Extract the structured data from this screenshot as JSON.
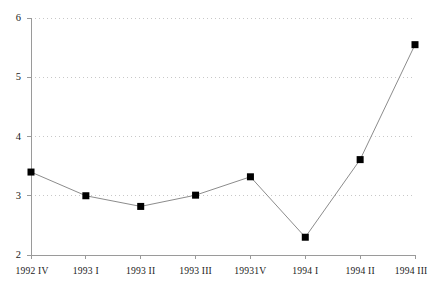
{
  "chart_data": {
    "type": "line",
    "title": "",
    "subtitle": "",
    "xlabel": "",
    "ylabel": "",
    "categories": [
      "1992 IV",
      "1993 I",
      "1993 II",
      "1993 III",
      "19931V",
      "1994 I",
      "1994 II",
      "1994 III"
    ],
    "values": [
      3.4,
      3.0,
      2.82,
      3.01,
      3.32,
      2.3,
      3.61,
      5.55
    ],
    "series": [
      {
        "name": "",
        "values": [
          3.4,
          3.0,
          2.82,
          3.01,
          3.32,
          2.3,
          3.61,
          5.55
        ]
      }
    ],
    "ylim": [
      2,
      6
    ],
    "yticks": [
      2,
      3,
      4,
      5,
      6
    ],
    "ytick_labels": [
      "2",
      "3",
      "4",
      "5",
      "6"
    ],
    "xlim_categories": 8,
    "grid": {
      "horizontal": true,
      "vertical": false,
      "style": "dotted",
      "color": "#c8c8c8"
    },
    "legend": {
      "visible": false,
      "position": "none",
      "entries": []
    },
    "marker": {
      "shape": "square",
      "color": "#000000",
      "size": 7
    },
    "line": {
      "color": "#8c8c8c",
      "width": 1
    },
    "axis": {
      "color": "#9a9a9a",
      "y_axis_visible": true,
      "x_axis_visible": true,
      "tick_direction": "out"
    },
    "annotations": [],
    "background_color": "#ffffff"
  }
}
